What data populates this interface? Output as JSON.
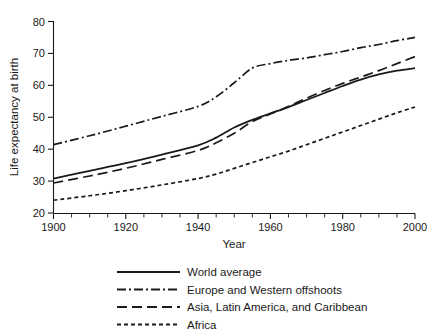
{
  "chart_data": {
    "type": "line",
    "title": "",
    "xlabel": "Year",
    "ylabel": "Life expectancy at birth",
    "xlim": [
      1900,
      2000
    ],
    "ylim": [
      20,
      80
    ],
    "xticks": [
      1900,
      1920,
      1940,
      1960,
      1980,
      2000
    ],
    "xtick_labels": [
      "1900",
      "1920",
      "1940",
      "1960",
      "1980",
      "2000"
    ],
    "xticks_minor_step": 5,
    "yticks": [
      20,
      30,
      40,
      50,
      60,
      70,
      80
    ],
    "ytick_labels": [
      "20",
      "30",
      "40",
      "50",
      "60",
      "70",
      "80"
    ],
    "grid": false,
    "legend_position": "below",
    "line_color": "#1a1a1a",
    "x": [
      1900,
      1910,
      1920,
      1930,
      1940,
      1945,
      1950,
      1955,
      1960,
      1965,
      1970,
      1975,
      1980,
      1985,
      1990,
      1995,
      2000
    ],
    "series": [
      {
        "name": "World average",
        "style": "solid",
        "dash": "none",
        "values": [
          30.8,
          33.2,
          35.6,
          38.3,
          41.2,
          43.6,
          46.8,
          49.2,
          51.2,
          53.2,
          55.4,
          57.6,
          59.8,
          61.8,
          63.4,
          64.6,
          65.4
        ]
      },
      {
        "name": "Europe and Western offshoots",
        "style": "dash-dot",
        "dash": "9,3,2,3",
        "values": [
          41.4,
          44.2,
          47.2,
          50.3,
          53.4,
          56.4,
          60.8,
          65.4,
          66.8,
          67.8,
          68.6,
          69.6,
          70.6,
          71.8,
          72.8,
          74.0,
          75.0
        ]
      },
      {
        "name": "Asia, Latin America, and Caribbean",
        "style": "long-dash",
        "dash": "10,5",
        "values": [
          29.4,
          31.6,
          34.0,
          36.8,
          39.6,
          42.0,
          45.0,
          48.6,
          51.0,
          53.4,
          56.0,
          58.4,
          60.6,
          62.6,
          64.6,
          66.8,
          69.0
        ]
      },
      {
        "name": "Africa",
        "style": "short-dash",
        "dash": "4,3",
        "values": [
          24.0,
          25.4,
          27.0,
          28.8,
          30.8,
          32.2,
          34.0,
          35.8,
          37.6,
          39.4,
          41.4,
          43.4,
          45.4,
          47.4,
          49.4,
          51.4,
          53.2
        ]
      }
    ]
  },
  "legend": {
    "items": [
      {
        "label": "World average",
        "dash": "none"
      },
      {
        "label": "Europe and Western offshoots",
        "dash": "9,3,2,3"
      },
      {
        "label": "Asia, Latin America, and Caribbean",
        "dash": "10,5"
      },
      {
        "label": "Africa",
        "dash": "4,3"
      }
    ]
  }
}
